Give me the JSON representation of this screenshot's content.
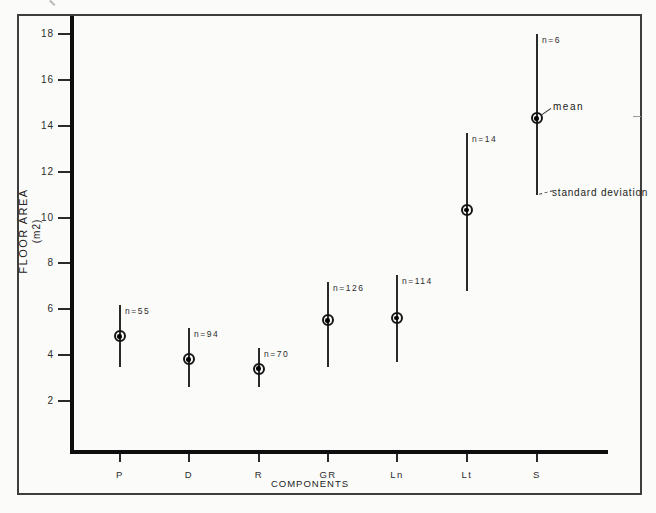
{
  "chart_data": {
    "type": "scatter",
    "title": "",
    "xlabel": "COMPONENTS",
    "ylabel": "FLOOR AREA",
    "ylabel_units": "(m2)",
    "categories": [
      "P",
      "D",
      "R",
      "GR",
      "Ln",
      "Lt",
      "S"
    ],
    "series": [
      {
        "name": "mean",
        "values": [
          4.8,
          3.8,
          3.4,
          5.5,
          5.6,
          10.3,
          14.3
        ]
      },
      {
        "name": "sd_upper",
        "values": [
          6.2,
          5.2,
          4.3,
          7.2,
          7.5,
          13.7,
          18.0
        ]
      },
      {
        "name": "sd_lower",
        "values": [
          3.5,
          2.6,
          2.6,
          3.5,
          3.7,
          6.8,
          11.0
        ]
      }
    ],
    "sample_sizes": [
      55,
      94,
      70,
      126,
      114,
      14,
      6
    ],
    "n_labels": [
      "n=55",
      "n=94",
      "n=70",
      "n=126",
      "n=114",
      "n=14",
      "n=6"
    ],
    "yticks": [
      2,
      4,
      6,
      8,
      10,
      12,
      14,
      16,
      18
    ],
    "ylim": [
      0,
      19
    ],
    "grid": false,
    "legend_position": "inline-annotations",
    "annotations": {
      "mean_label": "mean",
      "sd_label": "standard deviation"
    }
  },
  "colors": {
    "ink": "#141414",
    "axis": "#0e0e0e",
    "frame": "#3e3e3e",
    "background": "#fbfbf9",
    "text": "#2b2b2b"
  }
}
